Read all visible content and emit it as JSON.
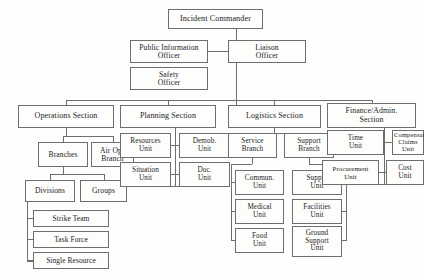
{
  "chart_data": {
    "type": "diagram",
    "orientation": "top-down",
    "nodes": [
      {
        "id": "incident-commander",
        "label": "Incident Commander",
        "x": 168,
        "y": 9,
        "w": 95,
        "h": 20,
        "fs": 8.2
      },
      {
        "id": "public-information-officer",
        "label": "Public Information\nOfficer",
        "x": 130,
        "y": 40,
        "w": 78,
        "h": 23,
        "fs": 7.6
      },
      {
        "id": "liaison-officer",
        "label": "Liaison\nOfficer",
        "x": 228,
        "y": 40,
        "w": 78,
        "h": 23,
        "fs": 7.6
      },
      {
        "id": "safety-officer",
        "label": "Safety\nOfficer",
        "x": 130,
        "y": 67,
        "w": 78,
        "h": 23,
        "fs": 7.6
      },
      {
        "id": "operations-section",
        "label": "Operations Section",
        "x": 18,
        "y": 105,
        "w": 96,
        "h": 23,
        "fs": 8.0
      },
      {
        "id": "planning-section",
        "label": "Planning Section",
        "x": 120,
        "y": 105,
        "w": 96,
        "h": 23,
        "fs": 8.0
      },
      {
        "id": "logistics-section",
        "label": "Logistics Section",
        "x": 228,
        "y": 105,
        "w": 93,
        "h": 23,
        "fs": 8.0
      },
      {
        "id": "finance-admin-section",
        "label": "Finance/Admin.\nSection",
        "x": 327,
        "y": 103,
        "w": 89,
        "h": 25,
        "fs": 7.8
      },
      {
        "id": "branches",
        "label": "Branches",
        "x": 38,
        "y": 142,
        "w": 50,
        "h": 25,
        "fs": 7.6
      },
      {
        "id": "air-ops-branch",
        "label": "Air Ops\nBranch",
        "x": 91,
        "y": 142,
        "w": 43,
        "h": 25,
        "fs": 7.6
      },
      {
        "id": "divisions",
        "label": "Divisions",
        "x": 25,
        "y": 180,
        "w": 50,
        "h": 22,
        "fs": 7.6
      },
      {
        "id": "groups",
        "label": "Groups",
        "x": 80,
        "y": 180,
        "w": 47,
        "h": 22,
        "fs": 7.6
      },
      {
        "id": "strike-team",
        "label": "Strike Team",
        "x": 33,
        "y": 210,
        "w": 76,
        "h": 17,
        "fs": 7.4
      },
      {
        "id": "task-force",
        "label": "Task Force",
        "x": 33,
        "y": 231,
        "w": 76,
        "h": 17,
        "fs": 7.4
      },
      {
        "id": "single-resource",
        "label": "Single Resource",
        "x": 33,
        "y": 252,
        "w": 76,
        "h": 17,
        "fs": 7.4
      },
      {
        "id": "resources-unit",
        "label": "Resources\nUnit",
        "x": 120,
        "y": 133,
        "w": 51,
        "h": 25,
        "fs": 7.2
      },
      {
        "id": "demob-unit",
        "label": "Demob.\nUnit",
        "x": 179,
        "y": 133,
        "w": 51,
        "h": 25,
        "fs": 7.2
      },
      {
        "id": "situation-unit",
        "label": "Situation\nUnit",
        "x": 120,
        "y": 162,
        "w": 51,
        "h": 25,
        "fs": 7.2
      },
      {
        "id": "doc-unit",
        "label": "Doc.\nUnit",
        "x": 179,
        "y": 162,
        "w": 51,
        "h": 25,
        "fs": 7.2
      },
      {
        "id": "service-branch",
        "label": "Service\nBranch",
        "x": 228,
        "y": 133,
        "w": 49,
        "h": 25,
        "fs": 7.2
      },
      {
        "id": "support-branch",
        "label": "Support\nBranch",
        "x": 284,
        "y": 133,
        "w": 50,
        "h": 25,
        "fs": 7.2
      },
      {
        "id": "communications-unit",
        "label": "Commun.\nUnit",
        "x": 235,
        "y": 170,
        "w": 49,
        "h": 25,
        "fs": 7.2
      },
      {
        "id": "supply-unit",
        "label": "Supply\nUnit",
        "x": 292,
        "y": 170,
        "w": 50,
        "h": 25,
        "fs": 7.2
      },
      {
        "id": "medical-unit",
        "label": "Medical\nUnit",
        "x": 235,
        "y": 199,
        "w": 49,
        "h": 25,
        "fs": 7.2
      },
      {
        "id": "facilities-unit",
        "label": "Facilities\nUnit",
        "x": 292,
        "y": 199,
        "w": 50,
        "h": 25,
        "fs": 7.2
      },
      {
        "id": "food-unit",
        "label": "Food\nUnit",
        "x": 235,
        "y": 228,
        "w": 49,
        "h": 25,
        "fs": 7.2
      },
      {
        "id": "ground-support-unit",
        "label": "Ground\nSupport\nUnit",
        "x": 292,
        "y": 226,
        "w": 50,
        "h": 31,
        "fs": 7.2
      },
      {
        "id": "time-unit",
        "label": "Time\nUnit",
        "x": 327,
        "y": 130,
        "w": 57,
        "h": 25,
        "fs": 7.2
      },
      {
        "id": "compensation-claims-unit",
        "label": "Compensation\nClaims Unit",
        "x": 392,
        "y": 130,
        "w": 32,
        "h": 25,
        "fs": 6.6
      },
      {
        "id": "procurement-unit",
        "label": "Procurement\nUnit",
        "x": 322,
        "y": 160,
        "w": 57,
        "h": 25,
        "fs": 6.8
      },
      {
        "id": "cost-unit",
        "label": "Cost\nUnit",
        "x": 386,
        "y": 160,
        "w": 38,
        "h": 25,
        "fs": 7.2
      }
    ],
    "connectors": [
      {
        "id": "ic-trunk",
        "orient": "v",
        "x": 236,
        "y": 29,
        "len": 76
      },
      {
        "id": "pio-tie",
        "orient": "h",
        "x": 208,
        "y": 51,
        "len": 20
      },
      {
        "id": "liaison-tie",
        "orient": "h",
        "x": 236,
        "y": 51,
        "len": -8
      },
      {
        "id": "section-bus",
        "orient": "h",
        "x": 66,
        "y": 100,
        "len": 306
      },
      {
        "id": "ops-drop",
        "orient": "v",
        "x": 66,
        "y": 100,
        "len": 5
      },
      {
        "id": "plan-drop",
        "orient": "v",
        "x": 168,
        "y": 100,
        "len": 5
      },
      {
        "id": "log-drop",
        "orient": "v",
        "x": 274,
        "y": 100,
        "len": 5
      },
      {
        "id": "fin-drop",
        "orient": "v",
        "x": 372,
        "y": 100,
        "len": 3
      },
      {
        "id": "ops-stem",
        "orient": "v",
        "x": 66,
        "y": 128,
        "len": 8
      },
      {
        "id": "ops-bar",
        "orient": "h",
        "x": 63,
        "y": 136,
        "len": 50
      },
      {
        "id": "branches-drop",
        "orient": "v",
        "x": 63,
        "y": 136,
        "len": 6
      },
      {
        "id": "airops-drop",
        "orient": "v",
        "x": 113,
        "y": 136,
        "len": 6
      },
      {
        "id": "branches-stem",
        "orient": "v",
        "x": 63,
        "y": 167,
        "len": 7
      },
      {
        "id": "branches-bar",
        "orient": "h",
        "x": 50,
        "y": 174,
        "len": 54
      },
      {
        "id": "divisions-drop",
        "orient": "v",
        "x": 50,
        "y": 174,
        "len": 6
      },
      {
        "id": "groups-drop",
        "orient": "v",
        "x": 104,
        "y": 174,
        "len": 6
      },
      {
        "id": "div-rail",
        "orient": "v",
        "x": 27,
        "y": 202,
        "len": 59
      },
      {
        "id": "div-rail-foot",
        "orient": "h",
        "x": 27,
        "y": 261,
        "len": 6
      },
      {
        "id": "strike-tie",
        "orient": "h",
        "x": 27,
        "y": 218,
        "len": 6
      },
      {
        "id": "task-tie",
        "orient": "h",
        "x": 27,
        "y": 239,
        "len": 6
      },
      {
        "id": "single-tie",
        "orient": "h",
        "x": 27,
        "y": 260,
        "len": 6
      },
      {
        "id": "plan-rail",
        "orient": "v",
        "x": 175,
        "y": 128,
        "len": 58
      },
      {
        "id": "plan-res-tie",
        "orient": "h",
        "x": 171,
        "y": 145,
        "len": 8
      },
      {
        "id": "plan-sit-tie",
        "orient": "h",
        "x": 171,
        "y": 174,
        "len": 8
      },
      {
        "id": "plan-foot",
        "orient": "h",
        "x": 171,
        "y": 186,
        "len": 8
      },
      {
        "id": "log-stem",
        "orient": "v",
        "x": 274,
        "y": 128,
        "len": 5
      },
      {
        "id": "log-bar",
        "orient": "h",
        "x": 252,
        "y": 133,
        "len": 57
      },
      {
        "id": "svc-rail-stem",
        "orient": "v",
        "x": 252,
        "y": 158,
        "len": 6
      },
      {
        "id": "svc-rail-bar",
        "orient": "h",
        "x": 231,
        "y": 164,
        "len": 21
      },
      {
        "id": "svc-rail",
        "orient": "v",
        "x": 231,
        "y": 164,
        "len": 77
      },
      {
        "id": "svc-commun-tie",
        "orient": "h",
        "x": 231,
        "y": 182,
        "len": 5
      },
      {
        "id": "svc-medical-tie",
        "orient": "h",
        "x": 231,
        "y": 211,
        "len": 5
      },
      {
        "id": "svc-food-tie",
        "orient": "h",
        "x": 231,
        "y": 240,
        "len": 5
      },
      {
        "id": "sup-rail-stem",
        "orient": "v",
        "x": 309,
        "y": 158,
        "len": 6
      },
      {
        "id": "sup-rail-bar",
        "orient": "h",
        "x": 309,
        "y": 164,
        "len": 38
      },
      {
        "id": "sup-rail",
        "orient": "v",
        "x": 346,
        "y": 164,
        "len": 77
      },
      {
        "id": "sup-supply-tie",
        "orient": "h",
        "x": 342,
        "y": 182,
        "len": 5
      },
      {
        "id": "sup-fac-tie",
        "orient": "h",
        "x": 342,
        "y": 211,
        "len": 5
      },
      {
        "id": "sup-ground-tie",
        "orient": "h",
        "x": 342,
        "y": 240,
        "len": 5
      },
      {
        "id": "fin-rail",
        "orient": "v",
        "x": 384,
        "y": 128,
        "len": 56
      },
      {
        "id": "fin-time-tie",
        "orient": "h",
        "x": 379,
        "y": 142,
        "len": 13
      },
      {
        "id": "fin-proc-tie",
        "orient": "h",
        "x": 379,
        "y": 172,
        "len": 7
      },
      {
        "id": "fin-foot",
        "orient": "h",
        "x": 379,
        "y": 184,
        "len": 7
      }
    ]
  }
}
